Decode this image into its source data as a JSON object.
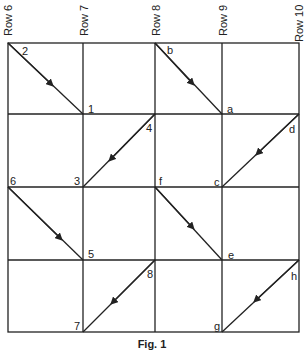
{
  "figure": {
    "caption": "Fig. 1",
    "column_labels": [
      "Row 6",
      "Row 7",
      "Row 8",
      "Row 9",
      "Row 10"
    ],
    "grid": {
      "columns": 4,
      "rows": 4
    },
    "point_labels": {
      "p2": "2",
      "p1": "1",
      "p4": "4",
      "p3": "3",
      "p6": "6",
      "p5": "5",
      "p8": "8",
      "p7": "7",
      "pb": "b",
      "pa": "a",
      "pd": "d",
      "pc": "c",
      "pf": "f",
      "pe": "e",
      "ph": "h",
      "pg": "g"
    },
    "arrows": [
      {
        "from": "2",
        "to": "1",
        "direction": "down-right"
      },
      {
        "from": "4",
        "to": "3",
        "direction": "down-left"
      },
      {
        "from": "6",
        "to": "5",
        "direction": "down-right"
      },
      {
        "from": "8",
        "to": "7",
        "direction": "down-left"
      },
      {
        "from": "b",
        "to": "a",
        "direction": "down-right"
      },
      {
        "from": "d",
        "to": "c",
        "direction": "down-left"
      },
      {
        "from": "f",
        "to": "e",
        "direction": "down-right"
      },
      {
        "from": "h",
        "to": "g",
        "direction": "down-left"
      }
    ],
    "colors": {
      "line": "#222222",
      "background": "#ffffff"
    }
  }
}
